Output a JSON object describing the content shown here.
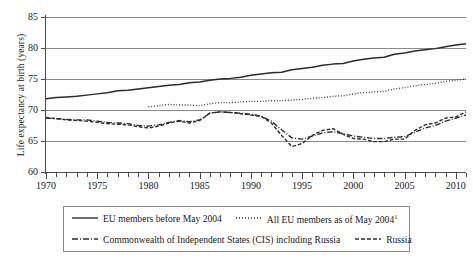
{
  "chart_data": {
    "type": "line",
    "title": "",
    "xlabel": "",
    "ylabel": "Life expectancy at birth (years)",
    "ylim": [
      60,
      85
    ],
    "xlim": [
      1970,
      2011
    ],
    "yticks": [
      60,
      65,
      70,
      75,
      80,
      85
    ],
    "xticks": [
      1970,
      1975,
      1980,
      1985,
      1990,
      1995,
      2000,
      2005,
      2010
    ],
    "xtick_minor_step": 1,
    "grid": "horizontal",
    "legend_position": "below-axis",
    "x": [
      1970,
      1971,
      1972,
      1973,
      1974,
      1975,
      1976,
      1977,
      1978,
      1979,
      1980,
      1981,
      1982,
      1983,
      1984,
      1985,
      1986,
      1987,
      1988,
      1989,
      1990,
      1991,
      1992,
      1993,
      1994,
      1995,
      1996,
      1997,
      1998,
      1999,
      2000,
      2001,
      2002,
      2003,
      2004,
      2005,
      2006,
      2007,
      2008,
      2009,
      2010,
      2011
    ],
    "series": [
      {
        "name": "EU members before May 2004",
        "style": "solid",
        "values": [
          71.8,
          72.0,
          72.1,
          72.2,
          72.4,
          72.6,
          72.8,
          73.1,
          73.2,
          73.4,
          73.6,
          73.8,
          74.0,
          74.1,
          74.4,
          74.5,
          74.8,
          75.0,
          75.1,
          75.3,
          75.6,
          75.8,
          76.0,
          76.1,
          76.5,
          76.7,
          76.9,
          77.2,
          77.4,
          77.5,
          77.9,
          78.2,
          78.4,
          78.5,
          79.0,
          79.2,
          79.5,
          79.7,
          79.9,
          80.2,
          80.5,
          80.7
        ]
      },
      {
        "name": "All EU members as of May 2004",
        "style": "dotted",
        "start_year": 1980,
        "values": [
          null,
          null,
          null,
          null,
          null,
          null,
          null,
          null,
          null,
          null,
          70.5,
          70.7,
          70.9,
          70.8,
          70.8,
          70.7,
          71.0,
          71.2,
          71.2,
          71.3,
          71.4,
          71.4,
          71.5,
          71.5,
          71.6,
          71.7,
          71.9,
          72.0,
          72.2,
          72.3,
          72.6,
          72.8,
          72.9,
          73.0,
          73.4,
          73.6,
          73.9,
          74.1,
          74.3,
          74.6,
          74.8,
          75.0
        ]
      },
      {
        "name": "Commonwealth of Independent States (CIS) including Russia",
        "style": "dashdot",
        "values": [
          68.7,
          68.6,
          68.5,
          68.4,
          68.4,
          68.2,
          68.0,
          67.9,
          67.8,
          67.5,
          67.4,
          67.6,
          68.0,
          68.3,
          68.1,
          68.4,
          69.5,
          69.7,
          69.6,
          69.5,
          69.3,
          69.0,
          68.2,
          66.8,
          65.5,
          65.3,
          65.8,
          66.3,
          66.5,
          66.2,
          65.8,
          65.6,
          65.4,
          65.4,
          65.6,
          65.7,
          66.4,
          67.1,
          67.5,
          68.2,
          68.7,
          69.2
        ]
      },
      {
        "name": "Russia",
        "style": "dashed",
        "values": [
          68.8,
          68.6,
          68.4,
          68.3,
          68.2,
          68.0,
          67.8,
          67.7,
          67.6,
          67.3,
          67.1,
          67.4,
          67.9,
          68.2,
          67.9,
          68.3,
          69.5,
          69.7,
          69.6,
          69.4,
          69.2,
          69.0,
          67.9,
          65.9,
          64.1,
          64.6,
          65.9,
          66.7,
          67.0,
          66.1,
          65.4,
          65.3,
          64.9,
          64.9,
          65.3,
          65.3,
          66.7,
          67.6,
          67.9,
          68.7,
          68.9,
          69.7
        ]
      }
    ]
  },
  "axis": {
    "y_title": "Life expectancy at birth (years)",
    "y_ticks": [
      "85",
      "80",
      "75",
      "70",
      "65",
      "60"
    ],
    "x_ticks": [
      "1970",
      "1975",
      "1980",
      "1985",
      "1990",
      "1995",
      "2000",
      "2005",
      "2010"
    ]
  },
  "legend": {
    "items": [
      {
        "label": "EU members before May 2004",
        "sup": "",
        "style": "solid"
      },
      {
        "label": "All EU members as of May 2004",
        "sup": "1",
        "style": "dotted"
      },
      {
        "label": "Commonwealth of Independent States (CIS) including Russia",
        "sup": "",
        "style": "dashdot"
      },
      {
        "label": "Russia",
        "sup": "",
        "style": "dashed"
      }
    ]
  },
  "colors": {
    "line": "#2b2b2b",
    "grid": "#8b8b8b",
    "axis": "#4a4a4a",
    "background": "#ffffff"
  }
}
